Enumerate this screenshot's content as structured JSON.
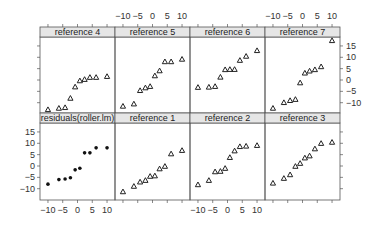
{
  "chart_data": {
    "type": "scatter",
    "title": "",
    "xlabel": "",
    "ylabel": "",
    "xlim": [
      -11,
      11
    ],
    "ylim": [
      -15,
      19
    ],
    "x_ticks": [
      -10,
      -5,
      0,
      5,
      10
    ],
    "y_ticks": [
      -10,
      -5,
      0,
      5,
      10,
      15
    ],
    "grid": false,
    "layout": "4 columns x 2 rows",
    "x": [
      -10,
      -6.3,
      -4.2,
      -2.4,
      -0.8,
      0.8,
      2.4,
      4.2,
      6.3,
      10
    ],
    "panels": [
      {
        "name": "reference 4",
        "row": "top",
        "col": 1,
        "marker": "triangle",
        "values": [
          -13,
          -12.4,
          -12.1,
          -8,
          -3,
          -0.3,
          0.3,
          1.2,
          1.2,
          1.6
        ]
      },
      {
        "name": "reference 5",
        "row": "top",
        "col": 2,
        "marker": "triangle",
        "values": [
          -11.5,
          -10.5,
          -4.6,
          -3.4,
          -2.8,
          1.9,
          4.1,
          8.1,
          8.1,
          9.2
        ]
      },
      {
        "name": "reference 6",
        "row": "top",
        "col": 3,
        "marker": "triangle",
        "values": [
          -3.2,
          -3.1,
          -2.8,
          1.3,
          4.6,
          4.7,
          4.7,
          8.7,
          10.5,
          13
        ]
      },
      {
        "name": "reference 7",
        "row": "top",
        "col": 4,
        "marker": "triangle",
        "values": [
          -12.4,
          -9.9,
          -9,
          -8.5,
          -1.2,
          3.1,
          4,
          4.6,
          5.9,
          17.4
        ]
      },
      {
        "name": "residuals(roller.lm)",
        "row": "bottom",
        "col": 1,
        "marker": "dot",
        "values": [
          -8,
          -6,
          -5.7,
          -5.2,
          -1.7,
          -1,
          5.8,
          5.8,
          8,
          8
        ]
      },
      {
        "name": "reference 1",
        "row": "bottom",
        "col": 2,
        "marker": "triangle",
        "values": [
          -11.3,
          -8.9,
          -7,
          -6.3,
          -4.5,
          -4.3,
          -1.2,
          -0.1,
          5.4,
          6.9
        ]
      },
      {
        "name": "reference 2",
        "row": "bottom",
        "col": 3,
        "marker": "triangle",
        "values": [
          -8.2,
          -6.3,
          -2.5,
          -2.3,
          -1,
          3.8,
          6.7,
          8.6,
          8.8,
          9.1
        ]
      },
      {
        "name": "reference 3",
        "row": "bottom",
        "col": 4,
        "marker": "triangle",
        "values": [
          -7.5,
          -5.4,
          -3.8,
          -0.1,
          1.2,
          3.6,
          4.5,
          7.6,
          10,
          10.5
        ]
      }
    ],
    "axes": {
      "bottom_labels_on_cols": [
        1,
        3
      ],
      "top_labels_on_cols": [
        2,
        4
      ],
      "left_labels_on_row": "bottom",
      "right_labels_on_row": "top"
    }
  }
}
